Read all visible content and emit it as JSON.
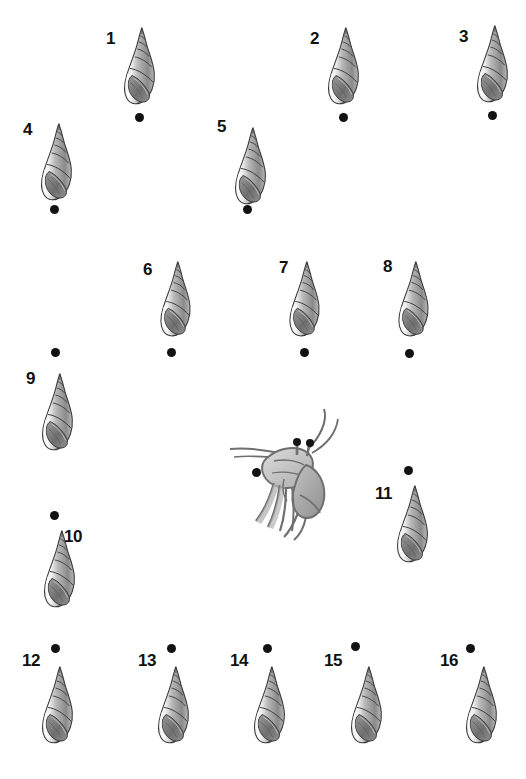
{
  "figure": {
    "type": "scientific-plate",
    "background_color": "#ffffff",
    "width": 526,
    "height": 779,
    "label_color": "#111111",
    "dot_color": "#121212",
    "shell_colors": {
      "outline": "#3a3a3a",
      "light": "#f2f2f2",
      "mid": "#b8b8b8",
      "dark": "#8a8a8a",
      "shadow": "#6e6e6e"
    },
    "crab_colors": {
      "outline": "#6f6f6f",
      "body": "#c9c9c9",
      "limb": "#b3b3b3",
      "eye": "#151515"
    }
  },
  "specimens": [
    {
      "id": "1",
      "label": "1",
      "shell_x": 118,
      "shell_y": 26,
      "shell_w": 46,
      "shell_h": 84,
      "label_x": 106,
      "label_y": 30,
      "dot_x": 135,
      "dot_y": 113
    },
    {
      "id": "2",
      "label": "2",
      "shell_x": 322,
      "shell_y": 26,
      "shell_w": 46,
      "shell_h": 84,
      "label_x": 310,
      "label_y": 30,
      "dot_x": 339,
      "dot_y": 113
    },
    {
      "id": "3",
      "label": "3",
      "shell_x": 471,
      "shell_y": 24,
      "shell_w": 46,
      "shell_h": 84,
      "label_x": 459,
      "label_y": 28,
      "dot_x": 488,
      "dot_y": 111
    },
    {
      "id": "4",
      "label": "4",
      "shell_x": 35,
      "shell_y": 122,
      "shell_w": 46,
      "shell_h": 84,
      "label_x": 23,
      "label_y": 121,
      "dot_x": 50,
      "dot_y": 205
    },
    {
      "id": "5",
      "label": "5",
      "shell_x": 229,
      "shell_y": 126,
      "shell_w": 46,
      "shell_h": 84,
      "label_x": 217,
      "label_y": 118,
      "dot_x": 243,
      "dot_y": 205
    },
    {
      "id": "6",
      "label": "6",
      "shell_x": 155,
      "shell_y": 260,
      "shell_w": 44,
      "shell_h": 82,
      "label_x": 143,
      "label_y": 261,
      "dot_x": 167,
      "dot_y": 348
    },
    {
      "id": "7",
      "label": "7",
      "shell_x": 284,
      "shell_y": 260,
      "shell_w": 44,
      "shell_h": 82,
      "label_x": 279,
      "label_y": 259,
      "dot_x": 300,
      "dot_y": 348
    },
    {
      "id": "8",
      "label": "8",
      "shell_x": 393,
      "shell_y": 260,
      "shell_w": 44,
      "shell_h": 82,
      "label_x": 383,
      "label_y": 258,
      "dot_x": 405,
      "dot_y": 349
    },
    {
      "id": "9",
      "label": "9",
      "shell_x": 36,
      "shell_y": 372,
      "shell_w": 46,
      "shell_h": 84,
      "label_x": 26,
      "label_y": 370,
      "dot_x": 51,
      "dot_y": 348
    },
    {
      "id": "10",
      "label": "10",
      "shell_x": 38,
      "shell_y": 529,
      "shell_w": 46,
      "shell_h": 84,
      "label_x": 64,
      "label_y": 528,
      "dot_x": 50,
      "dot_y": 511
    },
    {
      "id": "11",
      "label": "11",
      "shell_x": 391,
      "shell_y": 484,
      "shell_w": 46,
      "shell_h": 84,
      "label_x": 375,
      "label_y": 485,
      "dot_x": 404,
      "dot_y": 466
    },
    {
      "id": "12",
      "label": "12",
      "shell_x": 36,
      "shell_y": 665,
      "shell_w": 46,
      "shell_h": 84,
      "label_x": 22,
      "label_y": 652,
      "dot_x": 51,
      "dot_y": 644
    },
    {
      "id": "13",
      "label": "13",
      "shell_x": 152,
      "shell_y": 665,
      "shell_w": 46,
      "shell_h": 84,
      "label_x": 138,
      "label_y": 652,
      "dot_x": 167,
      "dot_y": 644
    },
    {
      "id": "14",
      "label": "14",
      "shell_x": 248,
      "shell_y": 665,
      "shell_w": 46,
      "shell_h": 84,
      "label_x": 230,
      "label_y": 652,
      "dot_x": 263,
      "dot_y": 644
    },
    {
      "id": "15",
      "label": "15",
      "shell_x": 345,
      "shell_y": 665,
      "shell_w": 46,
      "shell_h": 84,
      "label_x": 324,
      "label_y": 652,
      "dot_x": 351,
      "dot_y": 642
    },
    {
      "id": "16",
      "label": "16",
      "shell_x": 460,
      "shell_y": 665,
      "shell_w": 46,
      "shell_h": 84,
      "label_x": 440,
      "label_y": 652,
      "dot_x": 466,
      "dot_y": 644
    }
  ],
  "crab": {
    "name": "hermit-crab",
    "x": 228,
    "y": 403,
    "w": 120,
    "h": 140,
    "dot_x": 252,
    "dot_y": 468
  }
}
